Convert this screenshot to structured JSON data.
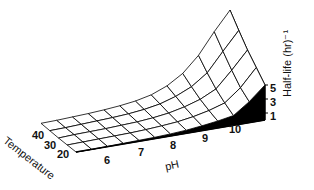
{
  "chart_data": {
    "type": "surface3d",
    "title": "",
    "xlabel": "pH",
    "ylabel": "Temperature",
    "zlabel": "Half-life (hr)⁻¹",
    "x_ticks": [
      "6",
      "7",
      "8",
      "9",
      "10"
    ],
    "y_ticks": [
      "20",
      "30",
      "40"
    ],
    "z_ticks": [
      "1",
      "3",
      "5"
    ],
    "x": [
      5.0,
      5.5,
      6.0,
      6.5,
      7.0,
      7.5,
      8.0,
      8.5,
      9.0,
      9.5,
      10.0,
      10.5,
      11.0
    ],
    "y": [
      20,
      25,
      30,
      35,
      40
    ],
    "z": [
      [
        0.0,
        0.0,
        0.05,
        0.1,
        0.15,
        0.2,
        0.3,
        0.45,
        0.7,
        1.0,
        1.4,
        3.0,
        5.0
      ],
      [
        0.0,
        0.05,
        0.1,
        0.15,
        0.2,
        0.3,
        0.45,
        0.65,
        1.0,
        1.5,
        2.2,
        4.0,
        6.5
      ],
      [
        0.0,
        0.1,
        0.15,
        0.2,
        0.3,
        0.4,
        0.6,
        0.9,
        1.4,
        2.1,
        3.2,
        5.5,
        8.0
      ],
      [
        0.05,
        0.1,
        0.2,
        0.3,
        0.4,
        0.55,
        0.8,
        1.2,
        1.9,
        2.9,
        4.5,
        7.2,
        9.8
      ],
      [
        0.1,
        0.15,
        0.25,
        0.35,
        0.5,
        0.7,
        1.0,
        1.5,
        2.4,
        3.8,
        6.0,
        9.0,
        11.7
      ]
    ],
    "xlim": [
      5,
      11
    ],
    "ylim": [
      20,
      40
    ],
    "zlim": [
      0,
      12
    ],
    "grid": true,
    "legend": "none",
    "colors": {
      "surface": "#ffffff",
      "lines": "#000000",
      "side": "#000000"
    }
  }
}
